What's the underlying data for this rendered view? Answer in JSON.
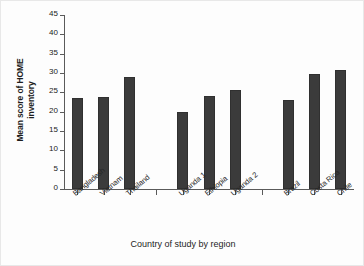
{
  "chart_data": {
    "type": "bar",
    "title": "",
    "xlabel": "Country of study by region",
    "ylabel": "Mean score of HOME inventory",
    "ylabel_lines": [
      "Mean score of HOME",
      "inventory"
    ],
    "categories": [
      "Bangladesh",
      "Vietnam",
      "Thailand",
      "Uganda 1",
      "Ethiopia",
      "Uganda 2",
      "Brazil",
      "Costa Rica",
      "Chile"
    ],
    "values": [
      23.5,
      23.8,
      29.0,
      19.9,
      24.1,
      25.5,
      23.1,
      29.7,
      30.7
    ],
    "ylim": [
      0,
      45
    ],
    "yticks": [
      0,
      5,
      10,
      15,
      20,
      25,
      30,
      35,
      40,
      45
    ],
    "ytick_labels": [
      "0",
      "5",
      "10",
      "15",
      "20",
      "25",
      "30",
      "35",
      "40",
      "45"
    ],
    "grid": false,
    "legend": null,
    "bar_color": "#3b3b3b",
    "axis_color": "#5a5a5a",
    "background_color": "#fdfdfd",
    "groups": [
      {
        "name": "Asia",
        "categories": [
          "Bangladesh",
          "Vietnam",
          "Thailand"
        ]
      },
      {
        "name": "Africa",
        "categories": [
          "Uganda 1",
          "Ethiopia",
          "Uganda 2"
        ]
      },
      {
        "name": "Latin America",
        "categories": [
          "Brazil",
          "Costa Rica",
          "Chile"
        ]
      }
    ],
    "slot_count": 11,
    "empty_slots": [
      3,
      7
    ]
  }
}
